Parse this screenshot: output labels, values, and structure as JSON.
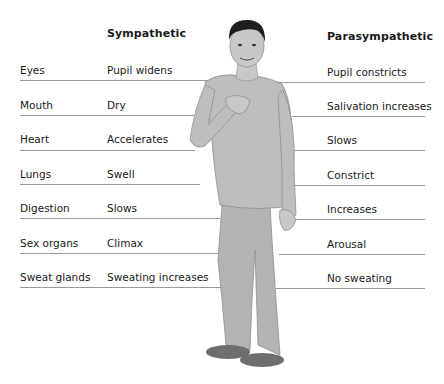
{
  "headers": {
    "sympathetic": "Sympathetic",
    "parasympathetic": "Parasympathetic"
  },
  "rows": [
    {
      "organ": "Eyes",
      "sympathetic": "Pupil widens",
      "parasympathetic": "Pupil constricts"
    },
    {
      "organ": "Mouth",
      "sympathetic": "Dry",
      "parasympathetic": "Salivation increases"
    },
    {
      "organ": "Heart",
      "sympathetic": "Accelerates",
      "parasympathetic": "Slows"
    },
    {
      "organ": "Lungs",
      "sympathetic": "Swell",
      "parasympathetic": "Constrict"
    },
    {
      "organ": "Digestion",
      "sympathetic": "Slows",
      "parasympathetic": "Increases"
    },
    {
      "organ": "Sex organs",
      "sympathetic": "Climax",
      "parasympathetic": "Arousal"
    },
    {
      "organ": "Sweat glands",
      "sympathetic": "Sweating increases",
      "parasympathetic": "No sweating"
    }
  ],
  "figure": {
    "colors": {
      "skin": "#c8c8c8",
      "shirt": "#bdbdbd",
      "pants": "#b3b3b3",
      "hair": "#1e1e1e",
      "shoes": "#6e6e6e",
      "line": "#9a9a9a"
    }
  }
}
